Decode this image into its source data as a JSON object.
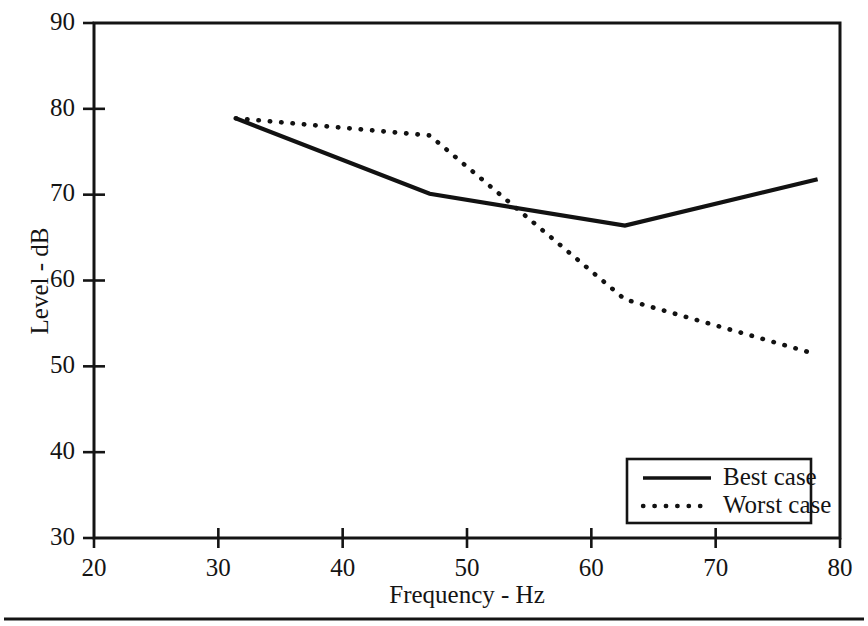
{
  "chart_data": {
    "type": "line",
    "title": "",
    "xlabel": "Frequency - Hz",
    "ylabel": "Level - dB",
    "xlim": [
      20,
      80
    ],
    "ylim": [
      30,
      90
    ],
    "xticks": [
      20,
      30,
      40,
      50,
      60,
      70,
      80
    ],
    "yticks": [
      30,
      40,
      50,
      60,
      70,
      80,
      90
    ],
    "xtick_labels": [
      "20",
      "30",
      "40",
      "50",
      "60",
      "70",
      "80"
    ],
    "ytick_labels": [
      "30",
      "40",
      "50",
      "60",
      "70",
      "80",
      "90"
    ],
    "grid": false,
    "legend_position": "bottom-right",
    "series": [
      {
        "name": "Best case",
        "style": "solid",
        "color": "#121212",
        "x": [
          31.4,
          47.0,
          62.7,
          78.2
        ],
        "y": [
          78.9,
          70.1,
          66.4,
          71.8
        ]
      },
      {
        "name": "Worst case",
        "style": "dotted",
        "color": "#121212",
        "x": [
          31.4,
          47.0,
          62.7,
          78.1
        ],
        "y": [
          78.9,
          76.9,
          57.8,
          51.4
        ]
      }
    ]
  },
  "axes": {
    "x_title": "Frequency - Hz",
    "y_title": "Level - dB"
  },
  "legend": {
    "entries": [
      {
        "label": "Best case",
        "style": "solid"
      },
      {
        "label": "Worst case",
        "style": "dotted"
      }
    ]
  }
}
